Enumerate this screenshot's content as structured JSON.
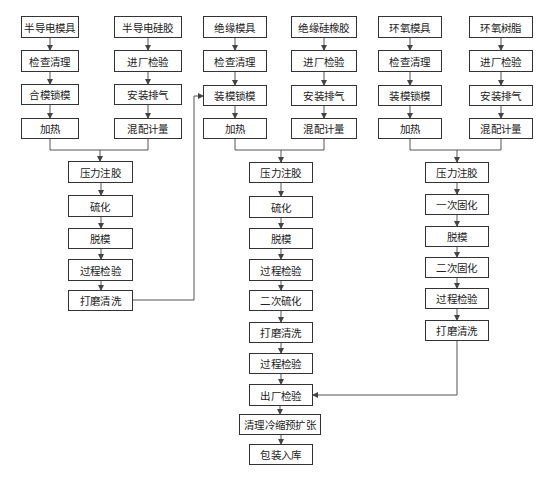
{
  "diagram": {
    "type": "process-flowchart",
    "colors": {
      "line": "#555555",
      "box_border": "#333333",
      "text": "#222222",
      "background": "#ffffff"
    },
    "nodes": [
      {
        "id": "n1",
        "label": "半导电模具",
        "x": 21,
        "y": 16,
        "w": 58,
        "h": 22
      },
      {
        "id": "n2",
        "label": "检查清理",
        "x": 21,
        "y": 50,
        "w": 58,
        "h": 22
      },
      {
        "id": "n3",
        "label": "合模锁模",
        "x": 21,
        "y": 84,
        "w": 58,
        "h": 21
      },
      {
        "id": "n4",
        "label": "加热",
        "x": 21,
        "y": 118,
        "w": 58,
        "h": 21
      },
      {
        "id": "n5",
        "label": "半导电硅胶",
        "x": 114,
        "y": 16,
        "w": 68,
        "h": 22
      },
      {
        "id": "n6",
        "label": "进厂检验",
        "x": 114,
        "y": 50,
        "w": 68,
        "h": 22
      },
      {
        "id": "n7",
        "label": "安装排气",
        "x": 114,
        "y": 84,
        "w": 68,
        "h": 21
      },
      {
        "id": "n8",
        "label": "混配计量",
        "x": 114,
        "y": 118,
        "w": 68,
        "h": 21
      },
      {
        "id": "n9",
        "label": "压力注胶",
        "x": 68,
        "y": 161,
        "w": 65,
        "h": 22
      },
      {
        "id": "n10",
        "label": "硫化",
        "x": 68,
        "y": 195,
        "w": 65,
        "h": 22
      },
      {
        "id": "n11",
        "label": "脱模",
        "x": 68,
        "y": 228,
        "w": 65,
        "h": 21
      },
      {
        "id": "n12",
        "label": "过程检验",
        "x": 68,
        "y": 259,
        "w": 65,
        "h": 22
      },
      {
        "id": "n13",
        "label": "打磨清洗",
        "x": 68,
        "y": 290,
        "w": 65,
        "h": 21
      },
      {
        "id": "n14",
        "label": "绝缘模具",
        "x": 203,
        "y": 16,
        "w": 64,
        "h": 22
      },
      {
        "id": "n15",
        "label": "检查清理",
        "x": 203,
        "y": 50,
        "w": 64,
        "h": 22
      },
      {
        "id": "n16",
        "label": "装模锁模",
        "x": 203,
        "y": 85,
        "w": 64,
        "h": 21
      },
      {
        "id": "n17",
        "label": "加热",
        "x": 203,
        "y": 118,
        "w": 64,
        "h": 21
      },
      {
        "id": "n18",
        "label": "绝缘硅橡胶",
        "x": 291,
        "y": 16,
        "w": 66,
        "h": 22
      },
      {
        "id": "n19",
        "label": "进厂检验",
        "x": 291,
        "y": 50,
        "w": 66,
        "h": 22
      },
      {
        "id": "n20",
        "label": "安装排气",
        "x": 291,
        "y": 85,
        "w": 66,
        "h": 21
      },
      {
        "id": "n21",
        "label": "混配计量",
        "x": 291,
        "y": 118,
        "w": 66,
        "h": 21
      },
      {
        "id": "n22",
        "label": "压力注胶",
        "x": 249,
        "y": 162,
        "w": 64,
        "h": 21
      },
      {
        "id": "n23",
        "label": "硫化",
        "x": 249,
        "y": 196,
        "w": 64,
        "h": 22
      },
      {
        "id": "n24",
        "label": "脱模",
        "x": 249,
        "y": 228,
        "w": 64,
        "h": 21
      },
      {
        "id": "n25",
        "label": "过程检验",
        "x": 249,
        "y": 259,
        "w": 64,
        "h": 22
      },
      {
        "id": "n26",
        "label": "二次硫化",
        "x": 249,
        "y": 290,
        "w": 64,
        "h": 21
      },
      {
        "id": "n27",
        "label": "打磨清洗",
        "x": 249,
        "y": 322,
        "w": 64,
        "h": 21
      },
      {
        "id": "n28",
        "label": "过程检验",
        "x": 249,
        "y": 353,
        "w": 64,
        "h": 21
      },
      {
        "id": "n29",
        "label": "出厂检验",
        "x": 249,
        "y": 384,
        "w": 64,
        "h": 22
      },
      {
        "id": "n30",
        "label": "清理冷缩预扩张",
        "x": 239,
        "y": 414,
        "w": 82,
        "h": 21
      },
      {
        "id": "n31",
        "label": "包装入库",
        "x": 249,
        "y": 444,
        "w": 64,
        "h": 21
      },
      {
        "id": "n32",
        "label": "环氧模具",
        "x": 378,
        "y": 16,
        "w": 64,
        "h": 22
      },
      {
        "id": "n33",
        "label": "检查清理",
        "x": 378,
        "y": 50,
        "w": 64,
        "h": 22
      },
      {
        "id": "n34",
        "label": "装模锁模",
        "x": 378,
        "y": 85,
        "w": 64,
        "h": 21
      },
      {
        "id": "n35",
        "label": "加热",
        "x": 378,
        "y": 118,
        "w": 64,
        "h": 21
      },
      {
        "id": "n36",
        "label": "环氧树脂",
        "x": 469,
        "y": 16,
        "w": 64,
        "h": 22
      },
      {
        "id": "n37",
        "label": "进厂检验",
        "x": 469,
        "y": 50,
        "w": 64,
        "h": 22
      },
      {
        "id": "n38",
        "label": "安装排气",
        "x": 469,
        "y": 85,
        "w": 64,
        "h": 21
      },
      {
        "id": "n39",
        "label": "混配计量",
        "x": 469,
        "y": 118,
        "w": 64,
        "h": 21
      },
      {
        "id": "n40",
        "label": "压力注胶",
        "x": 425,
        "y": 162,
        "w": 64,
        "h": 21
      },
      {
        "id": "n41",
        "label": "一次固化",
        "x": 425,
        "y": 194,
        "w": 64,
        "h": 21
      },
      {
        "id": "n42",
        "label": "脱模",
        "x": 425,
        "y": 226,
        "w": 64,
        "h": 21
      },
      {
        "id": "n43",
        "label": "二次固化",
        "x": 425,
        "y": 257,
        "w": 64,
        "h": 21
      },
      {
        "id": "n44",
        "label": "过程检验",
        "x": 425,
        "y": 288,
        "w": 64,
        "h": 21
      },
      {
        "id": "n45",
        "label": "打磨清洗",
        "x": 425,
        "y": 320,
        "w": 64,
        "h": 21
      }
    ],
    "edges": [
      {
        "from": "n1",
        "to": "n2"
      },
      {
        "from": "n2",
        "to": "n3"
      },
      {
        "from": "n3",
        "to": "n4"
      },
      {
        "from": "n5",
        "to": "n6"
      },
      {
        "from": "n6",
        "to": "n7"
      },
      {
        "from": "n7",
        "to": "n8"
      },
      {
        "from": "n4",
        "to": "n9",
        "via": "merge"
      },
      {
        "from": "n8",
        "to": "n9",
        "via": "merge"
      },
      {
        "from": "n9",
        "to": "n10"
      },
      {
        "from": "n10",
        "to": "n11"
      },
      {
        "from": "n11",
        "to": "n12"
      },
      {
        "from": "n12",
        "to": "n13"
      },
      {
        "from": "n13",
        "to": "n16",
        "via": "feedback"
      },
      {
        "from": "n14",
        "to": "n15"
      },
      {
        "from": "n15",
        "to": "n16"
      },
      {
        "from": "n16",
        "to": "n17"
      },
      {
        "from": "n18",
        "to": "n19"
      },
      {
        "from": "n19",
        "to": "n20"
      },
      {
        "from": "n20",
        "to": "n21"
      },
      {
        "from": "n17",
        "to": "n22",
        "via": "merge"
      },
      {
        "from": "n21",
        "to": "n22",
        "via": "merge"
      },
      {
        "from": "n22",
        "to": "n23"
      },
      {
        "from": "n23",
        "to": "n24"
      },
      {
        "from": "n24",
        "to": "n25"
      },
      {
        "from": "n25",
        "to": "n26"
      },
      {
        "from": "n26",
        "to": "n27"
      },
      {
        "from": "n27",
        "to": "n28"
      },
      {
        "from": "n28",
        "to": "n29"
      },
      {
        "from": "n29",
        "to": "n30"
      },
      {
        "from": "n30",
        "to": "n31"
      },
      {
        "from": "n32",
        "to": "n33"
      },
      {
        "from": "n33",
        "to": "n34"
      },
      {
        "from": "n34",
        "to": "n35"
      },
      {
        "from": "n36",
        "to": "n37"
      },
      {
        "from": "n37",
        "to": "n38"
      },
      {
        "from": "n38",
        "to": "n39"
      },
      {
        "from": "n35",
        "to": "n40",
        "via": "merge"
      },
      {
        "from": "n39",
        "to": "n40",
        "via": "merge"
      },
      {
        "from": "n40",
        "to": "n41"
      },
      {
        "from": "n41",
        "to": "n42"
      },
      {
        "from": "n42",
        "to": "n43"
      },
      {
        "from": "n43",
        "to": "n44"
      },
      {
        "from": "n44",
        "to": "n45"
      },
      {
        "from": "n45",
        "to": "n29",
        "via": "feedback"
      }
    ],
    "polylines": [
      {
        "points": [
          [
            50,
            139
          ],
          [
            50,
            150
          ],
          [
            148,
            150
          ],
          [
            148,
            139
          ]
        ],
        "arrow": false
      },
      {
        "points": [
          [
            100,
            150
          ],
          [
            100,
            161
          ]
        ],
        "arrow": true
      },
      {
        "points": [
          [
            235,
            139
          ],
          [
            235,
            150
          ],
          [
            324,
            150
          ],
          [
            324,
            139
          ]
        ],
        "arrow": false
      },
      {
        "points": [
          [
            281,
            150
          ],
          [
            281,
            162
          ]
        ],
        "arrow": true
      },
      {
        "points": [
          [
            410,
            139
          ],
          [
            410,
            150
          ],
          [
            501,
            150
          ],
          [
            501,
            139
          ]
        ],
        "arrow": false
      },
      {
        "points": [
          [
            457,
            150
          ],
          [
            457,
            162
          ]
        ],
        "arrow": true
      },
      {
        "points": [
          [
            133,
            300
          ],
          [
            194,
            300
          ],
          [
            194,
            96
          ],
          [
            203,
            96
          ]
        ],
        "arrow": true
      },
      {
        "points": [
          [
            457,
            341
          ],
          [
            457,
            395
          ],
          [
            313,
            395
          ]
        ],
        "arrow": true
      }
    ]
  }
}
